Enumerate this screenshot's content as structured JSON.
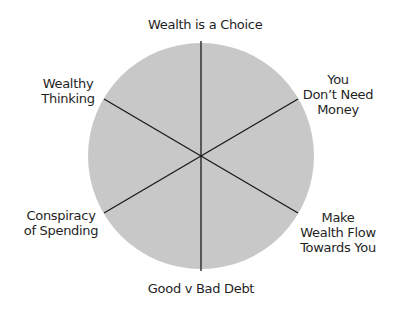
{
  "diagram": {
    "type": "segmented-wheel",
    "segments": 6,
    "fill_color": "#c8c8c8",
    "line_color": "#1a1a1a",
    "labels": [
      {
        "id": "top",
        "lines": [
          "Wealth is a Choice"
        ]
      },
      {
        "id": "upper-right",
        "lines": [
          "You",
          "Don’t Need",
          "Money"
        ]
      },
      {
        "id": "lower-right",
        "lines": [
          "Make",
          "Wealth Flow",
          "Towards You"
        ]
      },
      {
        "id": "bottom",
        "lines": [
          "Good v Bad Debt"
        ]
      },
      {
        "id": "lower-left",
        "lines": [
          "Conspiracy",
          "of Spending"
        ]
      },
      {
        "id": "upper-left",
        "lines": [
          "Wealthy",
          "Thinking"
        ]
      }
    ]
  }
}
